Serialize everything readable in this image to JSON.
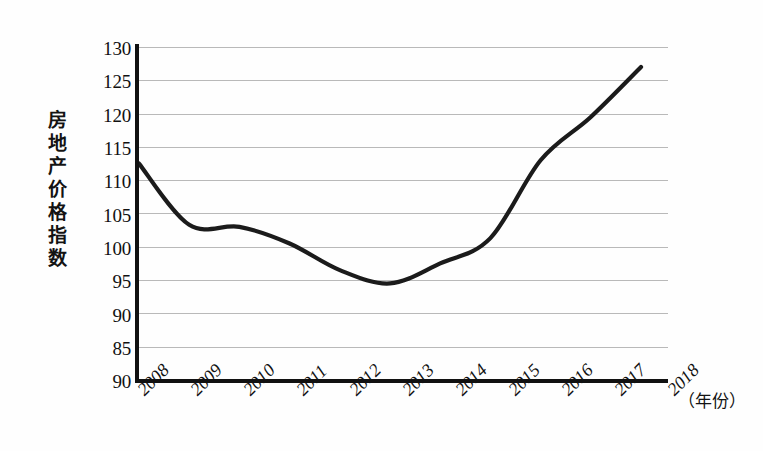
{
  "chart_data": {
    "type": "line",
    "title": "",
    "xlabel": "（年份）",
    "ylabel": "房地产价格指数",
    "ylabel_chars": [
      "房",
      "地",
      "产",
      "价",
      "格",
      "指",
      "数"
    ],
    "grid": true,
    "legend": false,
    "xlim": [
      2008,
      2018
    ],
    "ylim": [
      80,
      130
    ],
    "ytick_labels": [
      "130",
      "125",
      "120",
      "115",
      "110",
      "105",
      "100",
      "95",
      "90",
      "85",
      "90"
    ],
    "ytick_values": [
      130,
      125,
      120,
      115,
      110,
      105,
      100,
      95,
      90,
      85,
      80
    ],
    "categories": [
      "2008",
      "2009",
      "2010",
      "2011",
      "2012",
      "2013",
      "2014",
      "2015",
      "2016",
      "2017",
      "2018"
    ],
    "x": [
      2008,
      2009,
      2010,
      2011,
      2012,
      2013,
      2014,
      2015,
      2016,
      2017,
      2018
    ],
    "values": [
      112.5,
      103.3,
      103.0,
      100.5,
      96.5,
      94.5,
      97.5,
      101.3,
      113.0,
      119.5,
      127.0
    ],
    "series": [
      {
        "name": "房地产价格指数",
        "color": "#1b1b1b",
        "values": [
          112.5,
          103.3,
          103.0,
          100.5,
          96.5,
          94.5,
          97.5,
          101.3,
          113.0,
          119.5,
          127.0
        ]
      }
    ],
    "annotations": {
      "minimum_value": 94.2,
      "minimum_between": "2012-2013",
      "start_value": 112.5,
      "end_value": 127.0
    }
  },
  "style": {
    "background": "#fefefe",
    "axis_color": "#111111",
    "grid_color": "#b9b9b9",
    "line_color": "#1b1b1b",
    "text_color": "#111111"
  }
}
